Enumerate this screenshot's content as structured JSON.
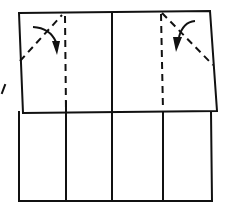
{
  "diagram": {
    "type": "origami-fold-step",
    "colors": {
      "ink": "#111111",
      "paper": "#ffffff"
    },
    "panels": 4,
    "fold_lines": [
      {
        "kind": "valley",
        "style": "dashed",
        "orientation": "vertical",
        "position": "left-quarter"
      },
      {
        "kind": "valley",
        "style": "dashed",
        "orientation": "vertical",
        "position": "right-quarter"
      },
      {
        "kind": "valley",
        "style": "dashed",
        "orientation": "diagonal",
        "position": "top-left-corner"
      },
      {
        "kind": "valley",
        "style": "dashed",
        "orientation": "diagonal",
        "position": "top-right-corner"
      }
    ],
    "arrows": [
      {
        "name": "fold-arrow-left",
        "direction": "fold corner down-right inward"
      },
      {
        "name": "fold-arrow-right",
        "direction": "fold corner down-left inward"
      }
    ],
    "side_mark": "/"
  }
}
